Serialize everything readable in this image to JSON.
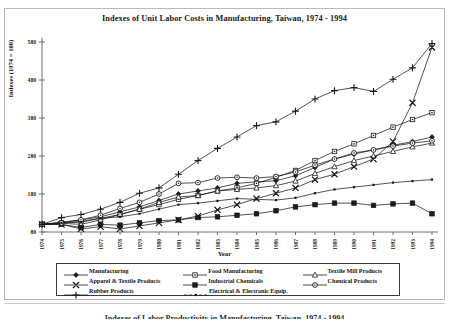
{
  "figure": {
    "title": "Indexes of Unit Labor Costs in Manufacturing, Taiwan, 1974 - 1994",
    "next_figure_title": "Indexes of Labor Productivity in Manufacturing, Taiwan, 1974 - 1994"
  },
  "chart_data": {
    "type": "line",
    "title": "Indexes of Unit Labor Costs in Manufacturing, Taiwan, 1974 - 1994",
    "xlabel": "Year",
    "ylabel": "Indexes (1974 = 100)",
    "grid": false,
    "legend_position": "bottom",
    "xlim": [
      1974,
      1994
    ],
    "ylim": [
      80,
      580
    ],
    "yticks": [
      80,
      180,
      280,
      380,
      480,
      580
    ],
    "categories": [
      1974,
      1975,
      1976,
      1977,
      1978,
      1979,
      1980,
      1981,
      1982,
      1983,
      1984,
      1985,
      1986,
      1987,
      1988,
      1989,
      1990,
      1991,
      1992,
      1993,
      1994
    ],
    "xticklabels": [
      "1974",
      "1975",
      "1976",
      "1977",
      "1978",
      "1979",
      "1980",
      "1981",
      "1982",
      "1983",
      "1984",
      "1985",
      "1986",
      "1987",
      "1988",
      "1989",
      "1990",
      "1991",
      "1992",
      "1993",
      "1994"
    ],
    "series": [
      {
        "name": "Manufacturing",
        "marker": "filled-diamond",
        "values": [
          100,
          106,
          112,
          120,
          133,
          146,
          163,
          180,
          188,
          196,
          208,
          212,
          215,
          228,
          250,
          272,
          285,
          296,
          308,
          318,
          330
        ]
      },
      {
        "name": "Food Manufacturing",
        "marker": "open-square",
        "values": [
          100,
          104,
          108,
          116,
          126,
          140,
          152,
          166,
          176,
          188,
          196,
          208,
          224,
          242,
          268,
          292,
          312,
          334,
          356,
          376,
          394
        ]
      },
      {
        "name": "Textile Mill Products",
        "marker": "open-triangle",
        "values": [
          100,
          103,
          100,
          112,
          126,
          140,
          158,
          172,
          176,
          188,
          192,
          196,
          202,
          214,
          234,
          252,
          268,
          280,
          292,
          304,
          314
        ]
      },
      {
        "name": "Apparel & Textile Products",
        "marker": "x-cross",
        "values": [
          100,
          100,
          88,
          94,
          88,
          96,
          104,
          112,
          122,
          138,
          152,
          168,
          182,
          196,
          218,
          232,
          252,
          272,
          318,
          420,
          566
        ]
      },
      {
        "name": "Industrial Chemicals",
        "marker": "filled-square",
        "values": [
          100,
          100,
          92,
          100,
          98,
          104,
          110,
          112,
          118,
          120,
          124,
          128,
          136,
          146,
          152,
          156,
          156,
          150,
          154,
          156,
          128
        ]
      },
      {
        "name": "Chemical Products",
        "marker": "open-circle",
        "values": [
          100,
          104,
          112,
          124,
          142,
          158,
          180,
          208,
          210,
          222,
          224,
          222,
          226,
          238,
          256,
          272,
          288,
          296,
          306,
          314,
          320
        ]
      },
      {
        "name": "Rubber Products",
        "marker": "plus-cross",
        "values": [
          100,
          118,
          126,
          140,
          158,
          182,
          196,
          232,
          268,
          300,
          330,
          360,
          370,
          398,
          430,
          452,
          460,
          450,
          482,
          512,
          576
        ]
      },
      {
        "name": "Electrical & Electronic Equip.",
        "marker": "small-dot",
        "values": [
          100,
          104,
          106,
          116,
          120,
          128,
          140,
          152,
          156,
          162,
          168,
          166,
          164,
          170,
          182,
          192,
          198,
          204,
          210,
          214,
          218
        ]
      }
    ]
  },
  "legend": {
    "rows": [
      [
        {
          "label": "Manufacturing",
          "marker": "filled-diamond"
        },
        {
          "label": "Food Manufacturing",
          "marker": "open-square"
        },
        {
          "label": "Textile Mill Products",
          "marker": "open-triangle"
        }
      ],
      [
        {
          "label": "Apparel & Textile Products",
          "marker": "x-cross"
        },
        {
          "label": "Industrial Chemicals",
          "marker": "filled-square"
        },
        {
          "label": "Chemical Products",
          "marker": "open-circle"
        }
      ],
      [
        {
          "label": "Rubber Products",
          "marker": "plus-cross"
        },
        {
          "label": "Electrical & Electronic Equip.",
          "marker": "small-dot"
        }
      ]
    ]
  },
  "colors": {
    "line": "#1a1a1a",
    "axis": "#6f6f6f",
    "frame": "#b9b9b9",
    "background": "#ffffff"
  }
}
